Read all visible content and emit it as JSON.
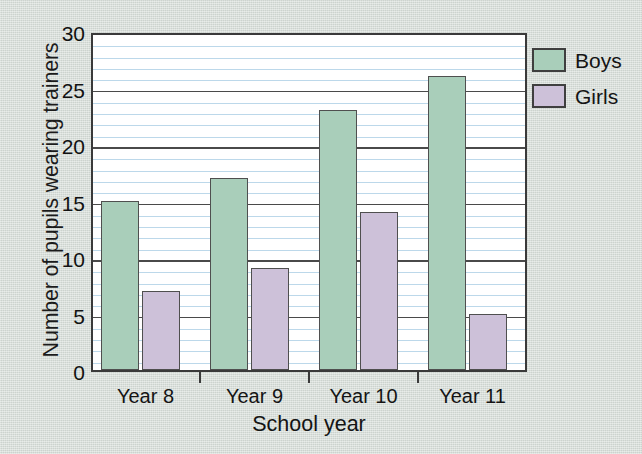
{
  "chart_data": {
    "type": "bar",
    "title": "",
    "xlabel": "School year",
    "ylabel": "Number of pupils wearing trainers",
    "categories": [
      "Year 8",
      "Year 9",
      "Year 10",
      "Year 11"
    ],
    "series": [
      {
        "name": "Boys",
        "values": [
          15,
          17,
          23,
          26
        ],
        "color": "#a9ceba"
      },
      {
        "name": "Girls",
        "values": [
          7,
          9,
          14,
          5
        ],
        "color": "#cdc1d9"
      }
    ],
    "ylim": [
      0,
      30
    ],
    "y_major_ticks": [
      0,
      5,
      10,
      15,
      20,
      25,
      30
    ],
    "y_tick_labels": [
      "0",
      "5",
      "10",
      "15",
      "20",
      "25",
      "30"
    ],
    "y_minor_step": 1,
    "grid": true,
    "grid_minor_color": "#bcd8ea",
    "grid_major_color": "#4a4a4a",
    "legend_position": "right-top",
    "background_color": "#d5dcd7",
    "plot_background_color": "#ffffff",
    "axis_color": "#3a3a3a"
  },
  "legend": {
    "entries": [
      {
        "label": "Boys",
        "color": "#a9ceba"
      },
      {
        "label": "Girls",
        "color": "#cdc1d9"
      }
    ]
  },
  "axes": {
    "y_title": "Number of pupils wearing trainers",
    "x_title": "School year"
  }
}
